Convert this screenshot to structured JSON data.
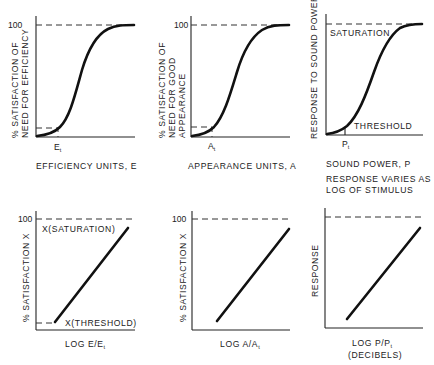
{
  "panels": [
    {
      "id": "efficiency-sigmoid",
      "y_tick": "100",
      "y_label_lines": [
        "% SATISFACTION OF",
        "NEED FOR EFFICIENCY"
      ],
      "x_label": "EFFICIENCY UNITS, E",
      "threshold_marker": "E",
      "threshold_sub": "t"
    },
    {
      "id": "appearance-sigmoid",
      "y_tick": "100",
      "y_label_lines": [
        "% SATISFACTION OF",
        "NEED FOR GOOD",
        "APPEARANCE"
      ],
      "x_label": "APPEARANCE UNITS, A",
      "threshold_marker": "A",
      "threshold_sub": "t"
    },
    {
      "id": "sound-sigmoid",
      "y_label_lines": [
        "RESPONSE TO SOUND POWER"
      ],
      "x_label": "SOUND POWER, P",
      "threshold_marker": "P",
      "threshold_sub": "t",
      "saturation_label": "SATURATION",
      "threshold_label": "THRESHOLD",
      "note_lines": [
        "RESPONSE VARIES AS",
        "LOG OF STIMULUS"
      ]
    },
    {
      "id": "efficiency-log",
      "y_tick": "100",
      "y_label_lines": [
        "% SATISFACTION X"
      ],
      "x_label_main": "LOG E/E",
      "x_label_sub": "t",
      "saturation_label": "X(SATURATION)",
      "threshold_label": "X(THRESHOLD)"
    },
    {
      "id": "appearance-log",
      "y_tick": "100",
      "y_label_lines": [
        "% SATISFACTION X"
      ],
      "x_label_main": "LOG A/A",
      "x_label_sub": "t"
    },
    {
      "id": "sound-log",
      "y_label_lines": [
        "RESPONSE"
      ],
      "x_label_main": "LOG P/P",
      "x_label_sub": "t",
      "x_label_line2": "(DECIBELS)"
    }
  ]
}
